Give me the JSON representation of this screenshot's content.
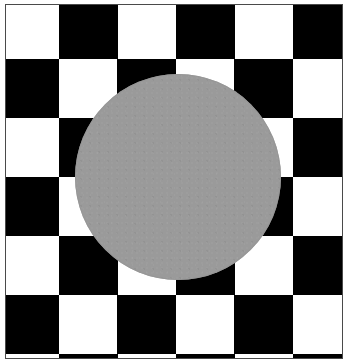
{
  "figure": {
    "canvas": {
      "width_px": 350,
      "height_px": 359
    },
    "frame": {
      "name": "thin dark rule border",
      "stroke_color": "#4a4a4a",
      "stroke_width_px": 1,
      "margin_color": "#ffffff",
      "left_px": 5,
      "top_px": 4,
      "width_px": 338,
      "height_px": 355
    },
    "background": {
      "name": "diagonal checkerboard",
      "pattern_type": "rotated-checkerboard",
      "light_color": "#ffffff",
      "dark_color": "#000000",
      "tile_width_px": 117,
      "tile_height_px": 118,
      "vertex_origin_x_px": 58,
      "vertex_origin_y_px": 58,
      "diamond_count_across": 3,
      "diamond_count_down": 3,
      "note": "pattern is cropped by the frame on all four sides"
    },
    "disc": {
      "name": "gray circle",
      "shape": "circle",
      "fill_color": "#9a9a9a",
      "center_x_px": 177,
      "center_y_px": 176,
      "radius_px": 103,
      "diameter_px": 206,
      "edge_quality": "dithered",
      "opacity": 1
    },
    "palette": {
      "black": "#000000",
      "white": "#ffffff",
      "gray": "#9a9a9a",
      "frame_gray": "#4a4a4a"
    }
  }
}
